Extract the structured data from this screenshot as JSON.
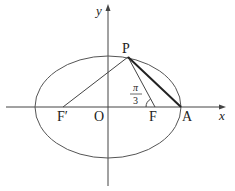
{
  "diagram": {
    "type": "ellipse-geometry",
    "axes": {
      "x_label": "x",
      "y_label": "y"
    },
    "points": {
      "P": {
        "label": "P",
        "x": 128,
        "y": 57
      },
      "F_prime": {
        "label": "F′",
        "x": 63,
        "y": 107
      },
      "O": {
        "label": "O",
        "x": 108,
        "y": 107
      },
      "F": {
        "label": "F",
        "x": 155,
        "y": 107
      },
      "A": {
        "label": "A",
        "x": 181,
        "y": 107
      }
    },
    "angle": {
      "numerator": "π",
      "denominator": "3",
      "at": "F",
      "between": "FP and FA"
    },
    "ellipse": {
      "cx": 108,
      "cy": 107,
      "rx": 73,
      "ry": 51
    },
    "segments": [
      "PF'",
      "PF",
      "PA (bold)"
    ]
  }
}
